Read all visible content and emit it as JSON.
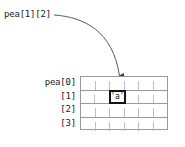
{
  "diagram": {
    "callout": {
      "label": "pea[1][2]"
    },
    "row_labels": [
      "pea[0]",
      "[1]",
      "[2]",
      "[3]"
    ],
    "grid": {
      "rows": 4,
      "columns": 6,
      "cells": [
        [
          "",
          "",
          "",
          "",
          "",
          ""
        ],
        [
          "",
          "",
          "'a'",
          "",
          "",
          ""
        ],
        [
          "",
          "",
          "",
          "",
          "",
          ""
        ],
        [
          "",
          "",
          "",
          "",
          "",
          ""
        ]
      ],
      "highlight": {
        "row": 1,
        "column": 2,
        "value": "'a'"
      }
    },
    "caption": "",
    "colors": {
      "grid_outline": "#9a9a9a",
      "grid_divider": "#bdbdbd",
      "highlight_border": "#141414",
      "arrow": "#555555",
      "text": "#1a1a1a",
      "background": "#ffffff"
    }
  }
}
